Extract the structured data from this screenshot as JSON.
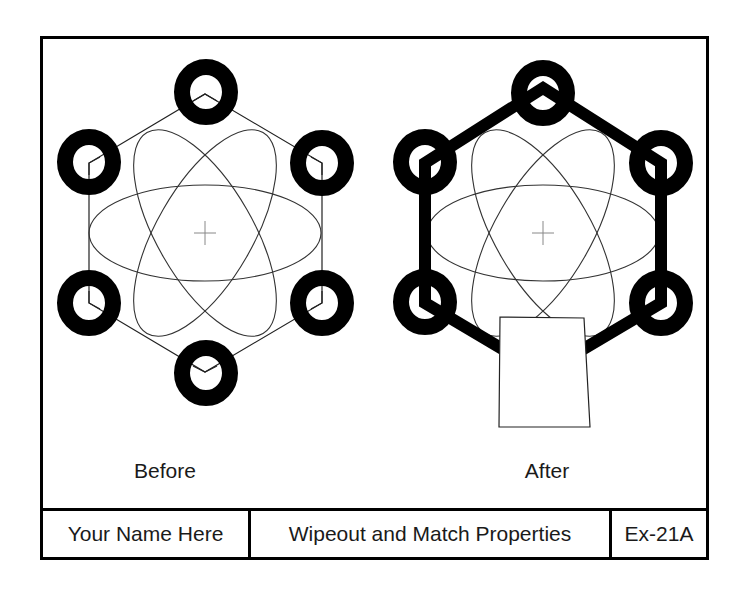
{
  "drawing": {
    "captions": {
      "before": "Before",
      "after": "After"
    },
    "title_block": {
      "name": "Your Name Here",
      "title": "Wipeout and Match Properties",
      "number": "Ex-21A"
    },
    "colors": {
      "ink": "#000000",
      "thin_line": "#333333",
      "center_mark": "#888888",
      "paper": "#ffffff"
    },
    "figures": [
      {
        "id": "before",
        "center": [
          205,
          233
        ],
        "hexagon_lineweight": "thin",
        "ring_count": 6,
        "wipeout": false
      },
      {
        "id": "after",
        "center": [
          543,
          233
        ],
        "hexagon_lineweight": "thick (matched from rings)",
        "ring_count": 6,
        "wipeout": true
      }
    ]
  }
}
